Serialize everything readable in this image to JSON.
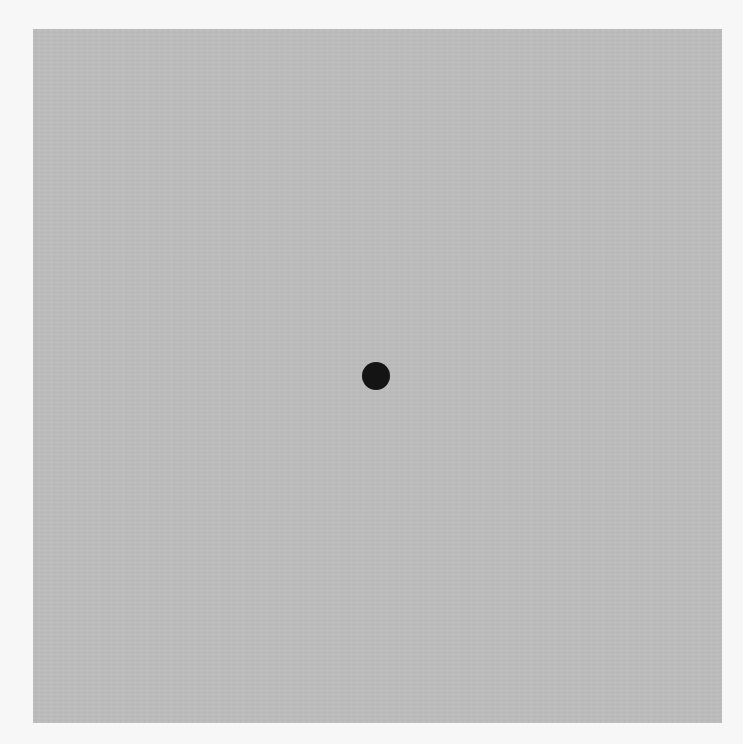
{
  "canvas": {
    "background_color": "#f7f7f7",
    "panel_color": "#bdbdbd",
    "dot_color": "#141414"
  },
  "fixation": {
    "shape": "circle"
  }
}
